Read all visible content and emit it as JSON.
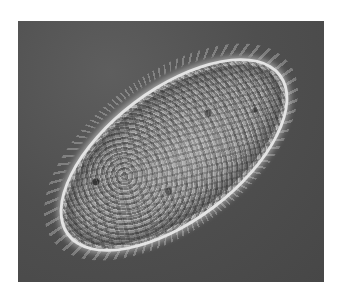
{
  "image": {
    "subject": "ciliated protozoan (paramecium-like cell) under phase-contrast microscopy",
    "colors": {
      "background": "#ffffff",
      "frame": "#4f4f4f",
      "cell_outline": "#e4e4e4",
      "cell_interior": "#8a8a8a"
    }
  }
}
